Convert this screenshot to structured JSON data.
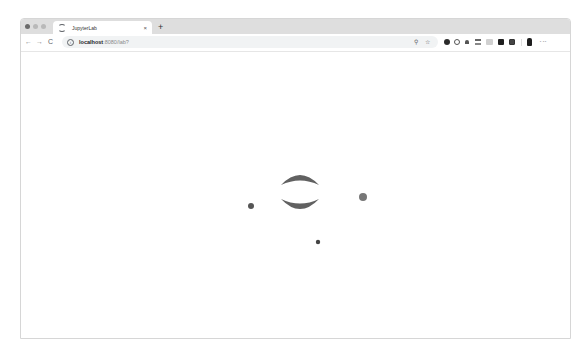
{
  "browser": {
    "traffic_lights": [
      "close",
      "minimize",
      "maximize"
    ],
    "tabs": [
      {
        "title": "JupyterLab",
        "icon": "loading-spinner-icon",
        "active": true,
        "close_label": "×"
      }
    ],
    "new_tab_label": "+",
    "nav": {
      "back": "←",
      "forward": "→",
      "reload": "C"
    },
    "address_bar": {
      "icon": "info-icon",
      "host": "localhost",
      "rest": ":8080/lab?",
      "zoom_icon": "⚲",
      "bookmark_icon": "☆"
    },
    "extensions": [
      "extension-1-icon",
      "extension-2-icon",
      "extension-3-icon",
      "extension-4-icon",
      "extension-5-icon",
      "extension-6-icon",
      "extension-7-icon"
    ],
    "profile_icon": "profile-icon",
    "menu_icon": "⋮"
  },
  "page": {
    "loader": {
      "color": "#616161",
      "arc_center": [
        300,
        192
      ],
      "arc_radius": 18,
      "dots": [
        {
          "x": 251,
          "y": 206,
          "r": 3
        },
        {
          "x": 363,
          "y": 197,
          "r": 4
        },
        {
          "x": 318,
          "y": 242,
          "r": 2.2
        }
      ]
    }
  }
}
